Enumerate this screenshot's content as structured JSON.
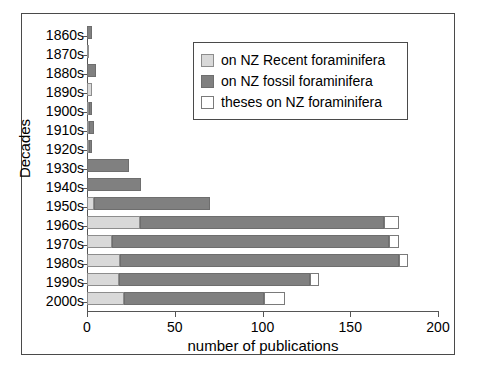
{
  "chart_data": {
    "type": "bar",
    "orientation": "horizontal",
    "stacked": true,
    "title": "",
    "xlabel": "number of publications",
    "ylabel": "Decades",
    "xlim": [
      0,
      200
    ],
    "xticks": [
      0,
      50,
      100,
      150,
      200
    ],
    "xtick_labels": [
      "0",
      "50",
      "100",
      "150",
      "200"
    ],
    "grid": false,
    "legend_position": "upper right",
    "categories": [
      "1860s",
      "1870s",
      "1880s",
      "1890s",
      "1900s",
      "1910s",
      "1920s",
      "1930s",
      "1940s",
      "1950s",
      "1960s",
      "1970s",
      "1980s",
      "1990s",
      "2000s"
    ],
    "series": [
      {
        "name": "on NZ Recent foraminifera",
        "color": "#d9d9d9",
        "values": [
          0,
          1,
          0,
          3,
          1,
          1,
          1,
          0,
          0,
          4,
          30,
          14,
          19,
          18,
          21
        ]
      },
      {
        "name": "on NZ fossil foraminifera",
        "color": "#808080",
        "values": [
          3,
          0,
          5,
          0,
          2,
          3,
          2,
          24,
          31,
          66,
          139,
          158,
          159,
          109,
          80
        ]
      },
      {
        "name": "theses on NZ foraminifera",
        "color": "#ffffff",
        "values": [
          0,
          0,
          0,
          0,
          0,
          0,
          0,
          0,
          0,
          0,
          9,
          6,
          5,
          5,
          12
        ]
      }
    ],
    "totals": [
      3,
      1,
      5,
      3,
      3,
      4,
      3,
      24,
      31,
      70,
      178,
      178,
      183,
      132,
      113
    ]
  },
  "legend": {
    "items": [
      {
        "label": "on NZ Recent foraminifera",
        "swatch": "recent-swatch"
      },
      {
        "label": "on NZ fossil foraminifera",
        "swatch": "fossil-swatch"
      },
      {
        "label": "theses on NZ foraminifera",
        "swatch": "theses-swatch"
      }
    ]
  },
  "axes": {
    "x_title": "number of publications",
    "y_title": "Decades"
  }
}
